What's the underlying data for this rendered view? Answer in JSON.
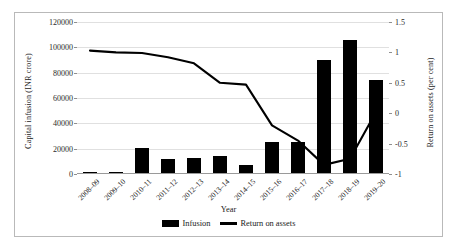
{
  "chart_data": {
    "type": "bar",
    "title": "",
    "categories": [
      "2008–09",
      "2009–10",
      "2010–11",
      "2011–12",
      "2012–13",
      "2013–14",
      "2014–15",
      "2015–16",
      "2016–17",
      "2017–18",
      "2018–19",
      "2019–20"
    ],
    "series": [
      {
        "name": "Infusion",
        "type": "bar",
        "axis": "left",
        "values": [
          1900,
          1200,
          20157,
          12000,
          12517,
          14000,
          6990,
          25000,
          24997,
          90000,
          106000,
          74000
        ]
      },
      {
        "name": "Return on assets",
        "type": "line",
        "axis": "right",
        "values": [
          1.03,
          1.0,
          0.99,
          0.92,
          0.82,
          0.5,
          0.47,
          -0.2,
          -0.45,
          -0.85,
          -0.75,
          0.02
        ]
      }
    ],
    "xlabel": "Year",
    "ylabel": "Capital infusion (INR crore)",
    "y2label": "Return on assets (per cent)",
    "ylim": [
      0,
      120000
    ],
    "y2lim": [
      -1,
      1.5
    ],
    "yticks": [
      "0",
      "20000",
      "40000",
      "60000",
      "80000",
      "100000",
      "120000"
    ],
    "ytick_values": [
      0,
      20000,
      40000,
      60000,
      80000,
      100000,
      120000
    ],
    "y2ticks": [
      "-1",
      "-0.5",
      "0",
      "0.5",
      "1",
      "1.5"
    ],
    "y2tick_values": [
      -1,
      -0.5,
      0,
      0.5,
      1,
      1.5
    ],
    "grid": true,
    "legend_position": "bottom",
    "legend": [
      "Infusion",
      "Return on assets"
    ],
    "colors": {
      "bar": "#000000",
      "line": "#000000",
      "grid": "#e0e0e0",
      "frame": "#b9b9b9"
    }
  }
}
